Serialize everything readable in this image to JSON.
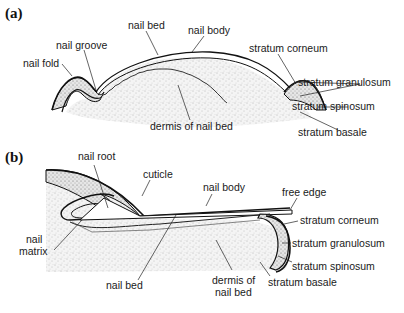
{
  "figure": {
    "panel_a": {
      "tag": "(a)",
      "labels": {
        "nail_bed": "nail bed",
        "nail_body": "nail body",
        "nail_groove": "nail groove",
        "nail_fold": "nail fold",
        "stratum_corneum": "stratum corneum",
        "stratum_granulosum": "stratum granulosum",
        "stratum_spinosum": "stratum spinosum",
        "stratum_basale": "stratum basale",
        "dermis": "dermis of nail bed"
      }
    },
    "panel_b": {
      "tag": "(b)",
      "labels": {
        "nail_root": "nail root",
        "cuticle": "cuticle",
        "nail_body": "nail body",
        "free_edge": "free edge",
        "stratum_corneum": "stratum corneum",
        "stratum_granulosum": "stratum granulosum",
        "stratum_spinosum": "stratum spinosum",
        "stratum_basale": "stratum basale",
        "nail_matrix_1": "nail",
        "nail_matrix_2": "matrix",
        "nail_bed": "nail bed",
        "dermis_1": "dermis of",
        "dermis_2": "nail bed"
      }
    }
  }
}
